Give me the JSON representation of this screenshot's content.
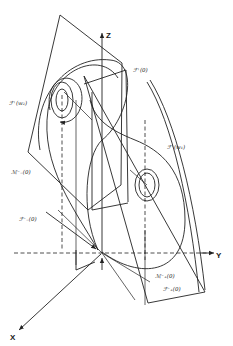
{
  "figure": {
    "axes": {
      "z_label": "Z",
      "y_label": "Y",
      "x_label": "X"
    },
    "labels": {
      "F_plus_0": "ℱ⁺(0)",
      "F_plus_w1": "ℱ⁺(w₁)",
      "F_plus_w2": "ℱ⁺(w₂)",
      "M_minus_0": "ℳ⁻₋(0)",
      "F_minus_0": "ℱ⁻₋(0)",
      "M_plus_0": "ℳ⁻₊(0)",
      "F_plus_plus_0": "ℱ⁻₊(0)"
    },
    "colors": {
      "ink": "#222222",
      "background": "#ffffff"
    }
  }
}
